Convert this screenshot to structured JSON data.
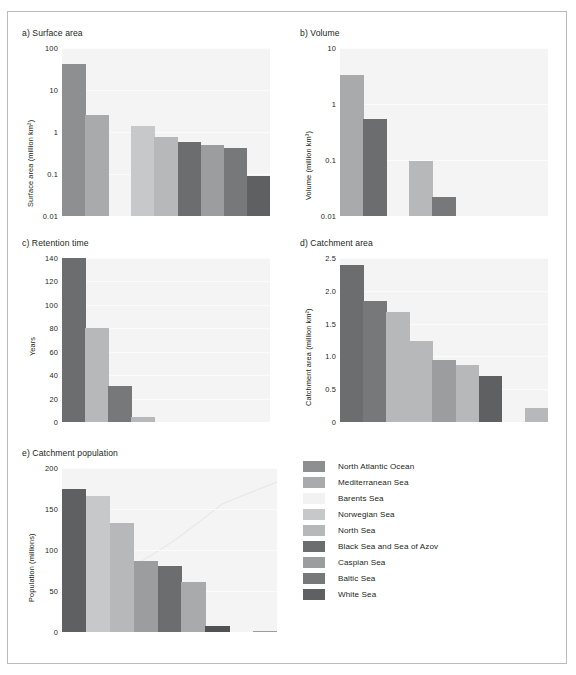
{
  "figure": {
    "width": 576,
    "height": 675,
    "background": "#ffffff",
    "border_color": "#b9bcbe",
    "plot_background": "#f4f4f4",
    "gridline_color": "#fbfbfb"
  },
  "legend": {
    "name": "sea-legend",
    "items": [
      {
        "label": "North Atlantic Ocean",
        "color": "#8d8f91"
      },
      {
        "label": "Mediterranean Sea",
        "color": "#a8aaac"
      },
      {
        "label": "Barents Sea",
        "color": "#f2f2f2"
      },
      {
        "label": "Norwegian Sea",
        "color": "#c6c8ca"
      },
      {
        "label": "North Sea",
        "color": "#b6b8ba"
      },
      {
        "label": "Black Sea and Sea of Azov",
        "color": "#6b6d6f"
      },
      {
        "label": "Caspian Sea",
        "color": "#9b9d9f"
      },
      {
        "label": "Baltic Sea",
        "color": "#76787a"
      },
      {
        "label": "White Sea",
        "color": "#5e6062"
      }
    ]
  },
  "chart_data": [
    {
      "id": "a",
      "type": "bar",
      "title": "a) Surface area",
      "ylabel": "Surface area (million km²)",
      "xlabel": "",
      "yscale": "log",
      "ylim": [
        0.01,
        100
      ],
      "yticks": [
        100,
        10,
        1,
        0.1,
        0.01
      ],
      "ytick_labels": [
        "100",
        "10",
        "1",
        "0.1",
        "0.01"
      ],
      "grid": true,
      "categories": [
        "North Atlantic Ocean",
        "Mediterranean Sea",
        "Barents Sea",
        "Norwegian Sea",
        "North Sea",
        "Black Sea and Sea of Azov",
        "Caspian Sea",
        "Baltic Sea",
        "White Sea"
      ],
      "values": [
        41.5,
        2.5,
        null,
        1.4,
        0.75,
        0.58,
        0.48,
        0.42,
        0.09
      ],
      "colors": [
        "#8d8f91",
        "#a8aaac",
        "#f2f2f2",
        "#c6c8ca",
        "#b6b8ba",
        "#6b6d6f",
        "#9b9d9f",
        "#76787a",
        "#5e6062"
      ]
    },
    {
      "id": "b",
      "type": "bar",
      "title": "b) Volume",
      "ylabel": "Volume (million km³)",
      "xlabel": "",
      "yscale": "log",
      "ylim": [
        0.01,
        10
      ],
      "yticks": [
        10,
        1,
        0.1,
        0.01
      ],
      "ytick_labels": [
        "10",
        "1",
        "0.1",
        "0.01"
      ],
      "grid": true,
      "categories": [
        "North Atlantic Ocean",
        "Mediterranean Sea",
        "Barents Sea",
        "Norwegian Sea",
        "North Sea",
        "Black Sea and Sea of Azov",
        "Caspian Sea",
        "Baltic Sea",
        "White Sea"
      ],
      "values": [
        3.3,
        0.55,
        null,
        0.095,
        0.022,
        null,
        null,
        null,
        null
      ],
      "colors": [
        "#a8aaac",
        "#6b6d6f",
        "#f2f2f2",
        "#b6b8ba",
        "#76787a",
        "#6b6d6f",
        "#9b9d9f",
        "#76787a",
        "#5e6062"
      ]
    },
    {
      "id": "c",
      "type": "bar",
      "title": "c) Retention time",
      "ylabel": "Years",
      "xlabel": "",
      "yscale": "linear",
      "ylim": [
        0,
        140
      ],
      "yticks": [
        0,
        20,
        40,
        60,
        80,
        100,
        120,
        140
      ],
      "ytick_labels": [
        "0",
        "20",
        "40",
        "60",
        "80",
        "100",
        "120",
        "140"
      ],
      "grid": true,
      "categories": [
        "North Atlantic Ocean",
        "Mediterranean Sea",
        "Barents Sea",
        "Norwegian Sea",
        "North Sea",
        "Black Sea and Sea of Azov",
        "Caspian Sea",
        "Baltic Sea",
        "White Sea"
      ],
      "values": [
        141,
        80,
        31,
        4,
        null,
        null,
        null,
        null,
        null
      ],
      "colors": [
        "#6b6d6f",
        "#b6b8ba",
        "#76787a",
        "#b6b8ba",
        "#b6b8ba",
        "#6b6d6f",
        "#9b9d9f",
        "#76787a",
        "#5e6062"
      ]
    },
    {
      "id": "d",
      "type": "bar",
      "title": "d) Catchment area",
      "ylabel": "Catchment area (million km²)",
      "xlabel": "",
      "yscale": "linear",
      "ylim": [
        0,
        2.5
      ],
      "yticks": [
        0,
        0.5,
        1.0,
        1.5,
        2.0,
        2.5
      ],
      "ytick_labels": [
        "0",
        "0.5",
        "1.0",
        "1.5",
        "2.0",
        "2.5"
      ],
      "grid": true,
      "categories": [
        "North Atlantic Ocean",
        "Mediterranean Sea",
        "Barents Sea",
        "Norwegian Sea",
        "North Sea",
        "Black Sea and Sea of Azov",
        "Caspian Sea",
        "Baltic Sea",
        "White Sea"
      ],
      "values": [
        2.39,
        1.84,
        1.68,
        1.24,
        0.95,
        0.87,
        0.7,
        null,
        0.22
      ],
      "colors": [
        "#6b6d6f",
        "#76787a",
        "#b6b8ba",
        "#b6b8ba",
        "#9b9d9f",
        "#b6b8ba",
        "#5e6062",
        "#f2f2f2",
        "#b6b8ba"
      ]
    },
    {
      "id": "e",
      "type": "bar",
      "title": "e) Catchment population",
      "ylabel": "Population (millions)",
      "xlabel": "",
      "yscale": "linear",
      "ylim": [
        0,
        200
      ],
      "yticks": [
        0,
        50,
        100,
        150,
        200
      ],
      "ytick_labels": [
        "0",
        "50",
        "100",
        "150",
        "200"
      ],
      "grid": true,
      "categories": [
        "North Atlantic Ocean",
        "Mediterranean Sea",
        "Barents Sea",
        "Norwegian Sea",
        "North Sea",
        "Black Sea and Sea of Azov",
        "Caspian Sea",
        "Baltic Sea",
        "White Sea"
      ],
      "values": [
        175,
        166,
        133,
        86,
        80,
        61,
        7,
        null,
        1
      ],
      "colors": [
        "#5e6062",
        "#c6c8ca",
        "#b6b8ba",
        "#9b9d9f",
        "#6b6d6f",
        "#a8aaac",
        "#4f5153",
        "#f2f2f2",
        "#9b9d9f"
      ]
    }
  ]
}
